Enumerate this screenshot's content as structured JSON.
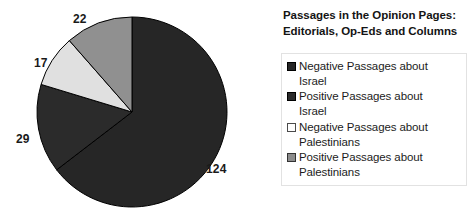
{
  "chart_data": {
    "type": "pie",
    "title": "Passages in the Opinion Pages: Editorials, Op-Eds and Columns",
    "title_lines": [
      "Passages in the Opinion Pages:",
      "Editorials, Op-Eds and Columns"
    ],
    "categories": [
      "Negative Passages about Israel",
      "Positive Passages about Israel",
      "Negative Passages about Palestinians",
      "Positive Passages about Palestinians"
    ],
    "values": [
      124,
      29,
      17,
      22
    ],
    "total": 192,
    "slice_colors": [
      "#262626",
      "#2b2b2b",
      "#e0e0e0",
      "#909090"
    ],
    "slice_edge_color": "#000000",
    "start_angle_deg": 0,
    "direction": "clockwise",
    "grid": false,
    "legend_position": "right",
    "xlabel": "",
    "ylabel": "",
    "slices": [
      {
        "label": "Negative Passages about Israel",
        "label_lines": "Negative Passages about\nIsrael",
        "value": 124,
        "data_label": "124",
        "color": "#262626",
        "swatch_fill": "#262626",
        "swatch_border": "#000000"
      },
      {
        "label": "Positive Passages about Israel",
        "label_lines": "Positive Passages about\nIsrael",
        "value": 29,
        "data_label": "29",
        "color": "#2b2b2b",
        "swatch_fill": "#2b2b2b",
        "swatch_border": "#000000"
      },
      {
        "label": "Negative Passages about Palestinians",
        "label_lines": "Negative Passages about\nPalestinians",
        "value": 17,
        "data_label": "17",
        "color": "#e0e0e0",
        "swatch_fill": "#fdfdfd",
        "swatch_border": "#4a4a4a"
      },
      {
        "label": "Positive Passages about Palestinians",
        "label_lines": "Positive Passages about\nPalestinians",
        "value": 22,
        "data_label": "22",
        "color": "#909090",
        "swatch_fill": "#8c8c8c",
        "swatch_border": "#333333"
      }
    ]
  }
}
